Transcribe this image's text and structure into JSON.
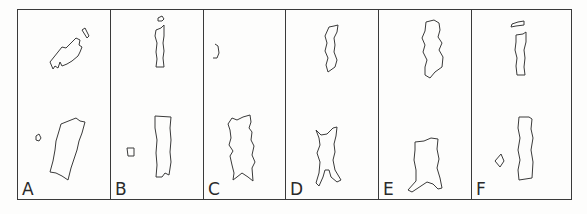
{
  "figure": {
    "panels": [
      {
        "id": "A",
        "label": "A",
        "width": 93
      },
      {
        "id": "B",
        "label": "B",
        "width": 93
      },
      {
        "id": "C",
        "label": "C",
        "width": 82
      },
      {
        "id": "D",
        "label": "D",
        "width": 93
      },
      {
        "id": "E",
        "label": "E",
        "width": 93
      },
      {
        "id": "F",
        "label": "F",
        "width": 101
      }
    ],
    "stroke_color": "#3a3a3a",
    "background": "#fdfdfc"
  }
}
